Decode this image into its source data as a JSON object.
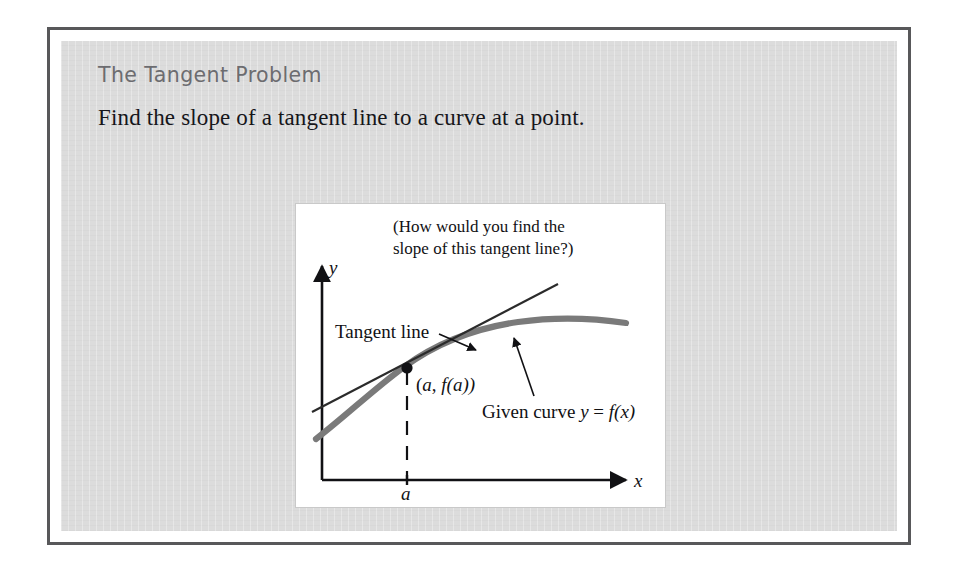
{
  "slide": {
    "title": "The Tangent Problem",
    "body": "Find the slope of a tangent line to a curve at a point.",
    "title_color": "#6c6c70",
    "body_color": "#16161a",
    "panel_color": "#dcdcdc",
    "frame_color": "#58585a"
  },
  "figure": {
    "caption_line1": "(How would you find the",
    "caption_line2": "slope of this tangent line?)",
    "axis_y_label": "y",
    "axis_x_label": "x",
    "tick_label_a": "a",
    "point_label": "(a, f(a))",
    "tangent_label": "Tangent line",
    "curve_label_prefix": "Given curve ",
    "curve_label_y": "y",
    "curve_label_eq": " = ",
    "curve_label_f": "f",
    "curve_label_arg": "(x)",
    "curve_color": "#7a7a7a",
    "tangent_color": "#2b2b2b",
    "axis_color": "#111114",
    "background": "#ffffff"
  },
  "chart_data": {
    "type": "line",
    "title": "The Tangent Problem",
    "xlabel": "x",
    "ylabel": "y",
    "grid": false,
    "legend": "none",
    "annotations": [
      "(How would you find the slope of this tangent line?)",
      "Tangent line",
      "(a, f(a))",
      "Given curve y = f(x)"
    ],
    "series": [
      {
        "name": "Given curve y = f(x)",
        "style": "thick-gray-curve",
        "x": [
          0.05,
          0.15,
          0.25,
          0.35,
          0.45,
          0.55,
          0.65,
          0.75,
          0.85,
          0.95
        ],
        "y": [
          0.18,
          0.33,
          0.45,
          0.555,
          0.64,
          0.705,
          0.745,
          0.765,
          0.765,
          0.745
        ]
      },
      {
        "name": "Tangent line",
        "style": "thin-black-line",
        "x": [
          0.03,
          1.0
        ],
        "y": [
          0.28,
          1.02
        ]
      }
    ],
    "points": [
      {
        "label": "(a, f(a))",
        "x": 0.37,
        "y": 0.575
      }
    ],
    "xticks": [
      "a"
    ],
    "yticks": []
  }
}
